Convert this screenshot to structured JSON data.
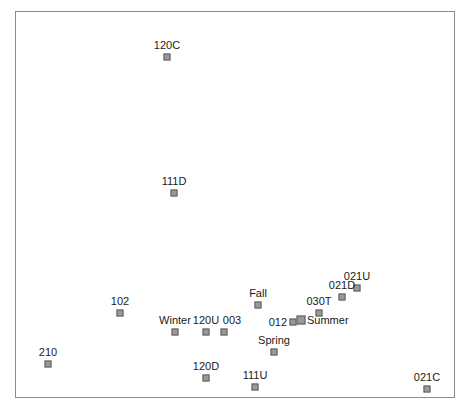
{
  "figure": {
    "title": "",
    "background_color": "#ffffff",
    "border_color": "#8a8a8a",
    "marker_fill": "#999999",
    "marker_stroke": "#5f5f5f",
    "label_color": "#1a1a1a"
  },
  "chart_data": {
    "type": "scatter",
    "title": "",
    "xlabel": "",
    "ylabel": "",
    "grid": false,
    "legend": "none",
    "axis_ticks_visible": false,
    "xlim": [
      0,
      440
    ],
    "ylim": [
      0,
      387
    ],
    "note": "Pixel coordinates measured within the plot frame; x to the right, y downward from the frame's top-left corner.",
    "points": [
      {
        "label": "120C",
        "x": 151,
        "y": 45,
        "label_pos": "above",
        "label_dx": 0,
        "label_dy": -6
      },
      {
        "label": "111D",
        "x": 158,
        "y": 181,
        "label_pos": "above",
        "label_dx": 0,
        "label_dy": -6
      },
      {
        "label": "021U",
        "x": 341,
        "y": 276,
        "label_pos": "above",
        "label_dx": 0,
        "label_dy": -6
      },
      {
        "label": "021D",
        "x": 326,
        "y": 285,
        "label_pos": "above",
        "label_dx": 0,
        "label_dy": -6
      },
      {
        "label": "030T",
        "x": 303,
        "y": 301,
        "label_pos": "above",
        "label_dx": 0,
        "label_dy": -6
      },
      {
        "label": "Fall",
        "x": 242,
        "y": 293,
        "label_pos": "above",
        "label_dx": 0,
        "label_dy": -6
      },
      {
        "label": "102",
        "x": 104,
        "y": 301,
        "label_pos": "above",
        "label_dx": 0,
        "label_dy": -6
      },
      {
        "label": "Winter",
        "x": 159,
        "y": 320,
        "label_pos": "above",
        "label_dx": 0,
        "label_dy": -6
      },
      {
        "label": "120U",
        "x": 190,
        "y": 320,
        "label_pos": "above",
        "label_dx": 0,
        "label_dy": -6
      },
      {
        "label": "003",
        "x": 208,
        "y": 320,
        "label_pos": "above",
        "label_dx": 8,
        "label_dy": -6
      },
      {
        "label": "012",
        "x": 277,
        "y": 310,
        "label_pos": "left",
        "label_dx": -6,
        "label_dy": 0
      },
      {
        "label": "Summer",
        "x": 285,
        "y": 308,
        "label_pos": "right",
        "label_dx": 6,
        "label_dy": 0,
        "marker_size": "big"
      },
      {
        "label": "Spring",
        "x": 258,
        "y": 340,
        "label_pos": "above",
        "label_dx": 0,
        "label_dy": -6
      },
      {
        "label": "210",
        "x": 32,
        "y": 352,
        "label_pos": "above",
        "label_dx": 0,
        "label_dy": -6
      },
      {
        "label": "120D",
        "x": 190,
        "y": 366,
        "label_pos": "above",
        "label_dx": 0,
        "label_dy": -6
      },
      {
        "label": "111U",
        "x": 239,
        "y": 375,
        "label_pos": "above",
        "label_dx": 0,
        "label_dy": -6
      },
      {
        "label": "021C",
        "x": 411,
        "y": 377,
        "label_pos": "above",
        "label_dx": 0,
        "label_dy": -6
      }
    ]
  }
}
